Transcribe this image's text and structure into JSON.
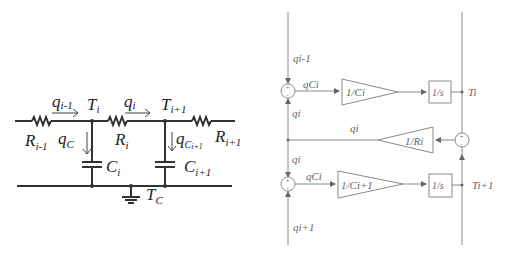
{
  "circuit": {
    "labels": {
      "q_prev": "q",
      "q_prev_sub": "i-1",
      "T_i": "T",
      "T_i_sub": "i",
      "q_i": "q",
      "q_i_sub": "i",
      "T_next": "T",
      "T_next_sub": "i+1",
      "R_prev": "R",
      "R_prev_sub": "i-1",
      "R_i": "R",
      "R_i_sub": "i",
      "R_next": "R",
      "R_next_sub": "i+1",
      "qC_i": "q",
      "qC_i_sub": "C",
      "qC_i_subsub": "i",
      "qC_next": "q",
      "qC_next_sub": "C",
      "qC_next_subsub": "i+1",
      "C_i": "C",
      "C_i_sub": "i",
      "C_next": "C",
      "C_next_sub": "i+1",
      "T_C": "T",
      "T_C_sub": "C"
    }
  },
  "block_diagram": {
    "signals": {
      "q_in_top": "qi-1",
      "qC_top": "qCi",
      "qi_top": "qi",
      "qi_mid": "qi",
      "qi_lower": "qi",
      "qC_bottom": "qCi",
      "q_in_bottom": "qi+1",
      "out_top": "Ti",
      "out_bottom": "Ti+1"
    },
    "blocks": {
      "gain_top": "1/Ci",
      "integrator_top": "1/s",
      "gain_resistance": "1/Ri",
      "gain_bottom": "1/Ci+1",
      "integrator_bottom": "1/s"
    },
    "sum_signs": {
      "plus": "+",
      "minus": "-"
    }
  }
}
